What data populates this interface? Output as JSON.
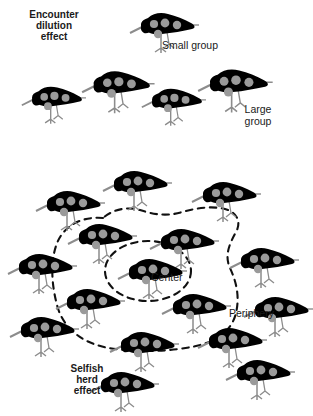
{
  "figure": {
    "title_hidden": "",
    "background_color": "#ffffff",
    "bird_body_color": "#000000",
    "bird_spot_color": "#9a9a9a",
    "bird_leg_color": "#8c8c8c",
    "dash_color": "#111111",
    "text_color": "#1a1a1a"
  },
  "labels": {
    "encounter_dilution": "Encounter\ndilution\neffect",
    "small_group": "Small group",
    "large_group": "Large\ngroup",
    "center": "Center",
    "periphery": "Periphery",
    "selfish_herd": "Selfish\nherd\neffect"
  },
  "groups": {
    "small_group": {
      "name": "small-group",
      "count": 1,
      "birds": [
        {
          "x": 128,
          "y": 8,
          "scale": 1.0
        }
      ]
    },
    "large_group": {
      "name": "large-group",
      "count": 4,
      "birds": [
        {
          "x": 20,
          "y": 82,
          "scale": 0.93
        },
        {
          "x": 80,
          "y": 66,
          "scale": 1.05
        },
        {
          "x": 140,
          "y": 84,
          "scale": 0.93
        },
        {
          "x": 196,
          "y": 64,
          "scale": 1.08
        }
      ]
    },
    "selfish_herd": {
      "name": "selfish-herd-flock",
      "count": 16,
      "birds": [
        {
          "x": 101,
          "y": 166,
          "scale": 1.0
        },
        {
          "x": 34,
          "y": 186,
          "scale": 1.0
        },
        {
          "x": 190,
          "y": 177,
          "scale": 1.0
        },
        {
          "x": 66,
          "y": 219,
          "scale": 1.0
        },
        {
          "x": 148,
          "y": 224,
          "scale": 1.0
        },
        {
          "x": 6,
          "y": 249,
          "scale": 1.0
        },
        {
          "x": 228,
          "y": 243,
          "scale": 1.0
        },
        {
          "x": 116,
          "y": 254,
          "scale": 1.0
        },
        {
          "x": 54,
          "y": 284,
          "scale": 1.0
        },
        {
          "x": 160,
          "y": 289,
          "scale": 1.0
        },
        {
          "x": 242,
          "y": 292,
          "scale": 1.0
        },
        {
          "x": 8,
          "y": 312,
          "scale": 1.0
        },
        {
          "x": 108,
          "y": 327,
          "scale": 1.0
        },
        {
          "x": 196,
          "y": 323,
          "scale": 1.0
        },
        {
          "x": 88,
          "y": 367,
          "scale": 1.0
        },
        {
          "x": 224,
          "y": 355,
          "scale": 1.0
        }
      ]
    }
  },
  "regions": {
    "center": {
      "name": "center-ellipse",
      "shape": "ellipse",
      "cx": 148,
      "cy": 271,
      "rx": 43,
      "ry": 30,
      "style": "dashed"
    },
    "periphery": {
      "name": "periphery-blob",
      "shape": "blob",
      "style": "dashed"
    }
  },
  "label_positions": {
    "encounter_dilution": {
      "x": 18,
      "y": 10,
      "size": 10
    },
    "small_group": {
      "x": 163,
      "y": 42,
      "size": 10
    },
    "large_group": {
      "x": 238,
      "y": 107,
      "size": 10
    },
    "center": {
      "x": 152,
      "y": 273,
      "size": 10
    },
    "periphery": {
      "x": 230,
      "y": 309,
      "size": 10
    },
    "selfish_herd": {
      "x": 60,
      "y": 364,
      "size": 10
    }
  }
}
